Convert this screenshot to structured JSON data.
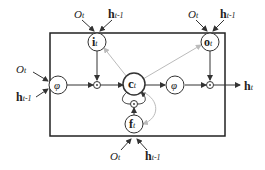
{
  "diagram": {
    "type": "LSTM cell",
    "nodes": {
      "input_gate": {
        "main": "i",
        "sub": "t"
      },
      "output_gate": {
        "main": "o",
        "sub": "t"
      },
      "forget_gate": {
        "main": "f",
        "sub": "t"
      },
      "cell": {
        "main": "c",
        "sub": "t"
      },
      "phi_in": "φ",
      "phi_out": "φ",
      "multiply": "·"
    },
    "inputs": {
      "o": {
        "main": "O",
        "sub": "t"
      },
      "h_prev": {
        "main": "h",
        "sub": "t-1"
      }
    },
    "output": {
      "main": "h",
      "sub": "t"
    },
    "colors": {
      "line": "#333333",
      "peephole": "#bbbbbb",
      "box": "#222222"
    }
  }
}
